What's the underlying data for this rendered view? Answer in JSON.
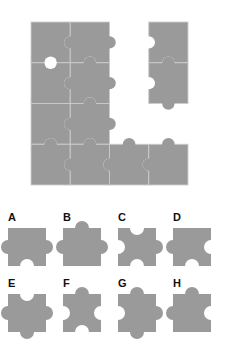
{
  "page": {
    "background_color": "#ffffff",
    "width": 235,
    "height": 360
  },
  "colors": {
    "piece_fill": "#9a9a9a",
    "piece_seam": "#cccccc",
    "hole_fill": "#ffffff",
    "label_text": "#111111"
  },
  "puzzle": {
    "name": "incomplete-jigsaw-assembly",
    "grid": {
      "cols": 4,
      "rows": 4,
      "x": 31,
      "y": 22,
      "cell_w": 39.25,
      "cell_h": 40.75
    },
    "description": "Partially assembled grey jigsaw with one missing piece gap",
    "placed_cells": [
      {
        "col": 0,
        "row": 0
      },
      {
        "col": 1,
        "row": 0
      },
      {
        "col": 0,
        "row": 1
      },
      {
        "col": 1,
        "row": 1
      },
      {
        "col": 0,
        "row": 2
      },
      {
        "col": 1,
        "row": 2
      },
      {
        "col": 0,
        "row": 3
      },
      {
        "col": 1,
        "row": 3
      },
      {
        "col": 2,
        "row": 3
      },
      {
        "col": 3,
        "row": 3
      },
      {
        "col": 3,
        "row": 0
      },
      {
        "col": 3,
        "row": 1
      }
    ],
    "missing_cells": [
      {
        "col": 2,
        "row": 0
      },
      {
        "col": 2,
        "row": 1
      },
      {
        "col": 2,
        "row": 2
      },
      {
        "col": 3,
        "row": 2
      }
    ],
    "gap_label": "missing-piece-region"
  },
  "options": {
    "count": 8,
    "piece_size": 38,
    "knob_radius": 7,
    "items": [
      {
        "id": "A",
        "label": "A",
        "x": 8,
        "y": 212,
        "fx": 8,
        "fy": 228,
        "edges": {
          "top": "flat",
          "right": "tab",
          "bottom": "hole",
          "left": "tab"
        }
      },
      {
        "id": "B",
        "label": "B",
        "x": 63,
        "y": 212,
        "fx": 63,
        "fy": 228,
        "edges": {
          "top": "tab",
          "right": "tab",
          "bottom": "flat",
          "left": "tab"
        }
      },
      {
        "id": "C",
        "label": "C",
        "x": 118,
        "y": 212,
        "fx": 118,
        "fy": 228,
        "edges": {
          "top": "hole",
          "right": "tab",
          "bottom": "hole",
          "left": "hole"
        }
      },
      {
        "id": "D",
        "label": "D",
        "x": 173,
        "y": 212,
        "fx": 173,
        "fy": 228,
        "edges": {
          "top": "flat",
          "right": "hole",
          "bottom": "hole",
          "left": "tab"
        }
      },
      {
        "id": "E",
        "label": "E",
        "x": 8,
        "y": 278,
        "fx": 8,
        "fy": 294,
        "edges": {
          "top": "hole",
          "right": "tab",
          "bottom": "tab",
          "left": "tab"
        }
      },
      {
        "id": "F",
        "label": "F",
        "x": 63,
        "y": 278,
        "fx": 63,
        "fy": 294,
        "edges": {
          "top": "tab",
          "right": "hole",
          "bottom": "hole",
          "left": "hole"
        }
      },
      {
        "id": "G",
        "label": "G",
        "x": 118,
        "y": 278,
        "fx": 118,
        "fy": 294,
        "edges": {
          "top": "tab",
          "right": "tab",
          "bottom": "tab",
          "left": "hole"
        }
      },
      {
        "id": "H",
        "label": "H",
        "x": 173,
        "y": 278,
        "fx": 173,
        "fy": 294,
        "edges": {
          "top": "tab",
          "right": "hole",
          "bottom": "flat",
          "left": "tab"
        }
      }
    ]
  },
  "assembly_pieces": [
    {
      "cell": "r0c0",
      "col": 0,
      "row": 0,
      "edges": {
        "top": "flat",
        "right": "hole",
        "bottom": "tab",
        "left": "flat"
      }
    },
    {
      "cell": "r0c1",
      "col": 1,
      "row": 0,
      "edges": {
        "top": "flat",
        "right": "tab",
        "bottom": "hole",
        "left": "tab"
      }
    },
    {
      "cell": "r1c0",
      "col": 0,
      "row": 1,
      "edges": {
        "top": "hole",
        "right": "hole",
        "bottom": "flat",
        "left": "flat"
      }
    },
    {
      "cell": "r1c1",
      "col": 1,
      "row": 1,
      "edges": {
        "top": "tab",
        "right": "tab",
        "bottom": "hole",
        "left": "tab"
      }
    },
    {
      "cell": "r2c0",
      "col": 0,
      "row": 2,
      "edges": {
        "top": "flat",
        "right": "hole",
        "bottom": "hole",
        "left": "flat"
      }
    },
    {
      "cell": "r2c1",
      "col": 1,
      "row": 2,
      "edges": {
        "top": "tab",
        "right": "tab",
        "bottom": "hole",
        "left": "tab"
      }
    },
    {
      "cell": "r3c0",
      "col": 0,
      "row": 3,
      "edges": {
        "top": "tab",
        "right": "hole",
        "bottom": "flat",
        "left": "flat"
      }
    },
    {
      "cell": "r3c1",
      "col": 1,
      "row": 3,
      "edges": {
        "top": "tab",
        "right": "hole",
        "bottom": "flat",
        "left": "tab"
      }
    },
    {
      "cell": "r3c2",
      "col": 2,
      "row": 3,
      "edges": {
        "top": "tab",
        "right": "hole",
        "bottom": "flat",
        "left": "tab"
      }
    },
    {
      "cell": "r3c3",
      "col": 3,
      "row": 3,
      "edges": {
        "top": "tab",
        "right": "flat",
        "bottom": "flat",
        "left": "tab"
      }
    },
    {
      "cell": "r0c3",
      "col": 3,
      "row": 0,
      "edges": {
        "top": "flat",
        "right": "flat",
        "bottom": "hole",
        "left": "hole"
      }
    },
    {
      "cell": "r1c3",
      "col": 3,
      "row": 1,
      "edges": {
        "top": "tab",
        "right": "flat",
        "bottom": "tab",
        "left": "hole"
      }
    }
  ]
}
